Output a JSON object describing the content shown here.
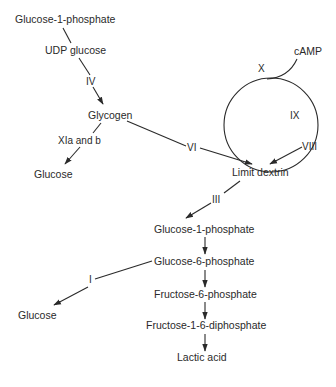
{
  "nodes": {
    "g1p_top": "Glucose-1-phosphate",
    "udp_glucose": "UDP glucose",
    "glycogen": "Glycogen",
    "glucose_left": "Glucose",
    "camp": "cAMP",
    "limit_dextrin": "Limit dextrin",
    "g1p_mid": "Glucose-1-phosphate",
    "g6p": "Glucose-6-phosphate",
    "glucose_bottom": "Glucose",
    "f6p": "Fructose-6-phosphate",
    "f16dp": "Fructose-1-6-diphosphate",
    "lactic_acid": "Lactic acid"
  },
  "enzymes": {
    "iv": "IV",
    "xi": "XIa and b",
    "vi": "VI",
    "x": "X",
    "ix": "IX",
    "viii": "VIII",
    "iii": "III",
    "i": "I"
  },
  "edges": [
    {
      "from": "Glucose-1-phosphate",
      "to": "UDP glucose",
      "label": ""
    },
    {
      "from": "UDP glucose",
      "to": "Glycogen",
      "label": "IV"
    },
    {
      "from": "Glycogen",
      "to": "Glucose",
      "label": "XIa and b"
    },
    {
      "from": "Glycogen",
      "to": "Limit dextrin",
      "label": "VI"
    },
    {
      "from": "cAMP",
      "to": "phosphorylase cascade loop",
      "label": "X"
    },
    {
      "from": "phosphorylase cascade loop",
      "to": "Limit dextrin",
      "label": "VIII"
    },
    {
      "from": "Limit dextrin",
      "to": "Glucose-1-phosphate",
      "label": "III"
    },
    {
      "from": "Glucose-1-phosphate",
      "to": "Glucose-6-phosphate",
      "label": ""
    },
    {
      "from": "Glucose-6-phosphate",
      "to": "Glucose",
      "label": "I"
    },
    {
      "from": "Glucose-6-phosphate",
      "to": "Fructose-6-phosphate",
      "label": ""
    },
    {
      "from": "Fructose-6-phosphate",
      "to": "Fructose-1-6-diphosphate",
      "label": ""
    },
    {
      "from": "Fructose-1-6-diphosphate",
      "to": "Lactic acid",
      "label": ""
    }
  ],
  "colors": {
    "ink": "#2a2a2a",
    "background": "#ffffff"
  }
}
